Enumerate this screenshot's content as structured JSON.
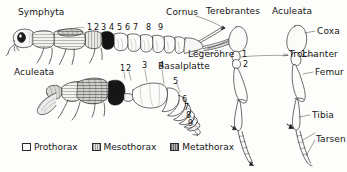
{
  "figure": {
    "language": "de",
    "background_color": "#fdfdfb",
    "ink_color": "#161616"
  },
  "panels": {
    "symphyta": {
      "label": "Symphyta",
      "segment_numbers": [
        "1",
        "2",
        "3",
        "4",
        "5",
        "6",
        "7",
        "8",
        "9"
      ],
      "callouts": [
        {
          "name": "cornus",
          "label": "Cornus"
        },
        {
          "name": "legerohre",
          "label": "Legeröhre"
        },
        {
          "name": "basalplatte",
          "label": "Basalplatte"
        }
      ]
    },
    "aculeata_body": {
      "label": "Aculeata",
      "segment_numbers": [
        "1",
        "2",
        "3",
        "4",
        "5",
        "6",
        "7",
        "8",
        "9"
      ]
    },
    "legs": {
      "left_label": "Terebrantes",
      "right_label": "Aculeata",
      "trochanter_numbers_left": [
        "1",
        "2"
      ],
      "trochanter_numbers_right": [
        "1"
      ],
      "callouts": [
        {
          "name": "coxa",
          "label": "Coxa"
        },
        {
          "name": "trochanter",
          "label": "Trochanter"
        },
        {
          "name": "femur",
          "label": "Femur"
        },
        {
          "name": "tibia",
          "label": "Tibia"
        },
        {
          "name": "tarsen",
          "label": "Tarsen"
        }
      ]
    }
  },
  "legend": {
    "items": [
      {
        "name": "prothorax",
        "label": "Prothorax",
        "color": "#fbfbfb"
      },
      {
        "name": "mesothorax",
        "label": "Mesothorax",
        "color": "#d6d6d6"
      },
      {
        "name": "metathorax",
        "label": "Metathorax",
        "color": "#9a9a9a"
      }
    ]
  }
}
